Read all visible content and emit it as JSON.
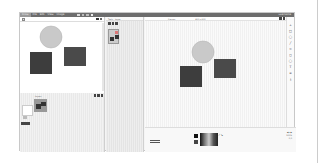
{
  "titlebar": {
    "logo": "Draw",
    "menus": [
      "File",
      "Edit",
      "View",
      "Image"
    ],
    "user": "username"
  },
  "left_panel": {
    "lower_label": "Layers",
    "thumb_label": "layer"
  },
  "mid_panel": {
    "tabs": [
      "Tools",
      "Layer"
    ]
  },
  "canvas": {
    "top_label": "Canvas",
    "size_label": "800 x 600"
  },
  "right_toolbar": {
    "tools": [
      "+",
      "□",
      "◯",
      "╱",
      "⊂",
      "◻",
      "◯",
      "T",
      "≡",
      "⤓"
    ]
  },
  "bottom": {
    "zoom": "100%",
    "info": "0,0"
  },
  "shapes": {
    "circle_color": "#c9c9c9",
    "square_color": "#3d3d3d",
    "square2_color": "#4a4a4a"
  }
}
